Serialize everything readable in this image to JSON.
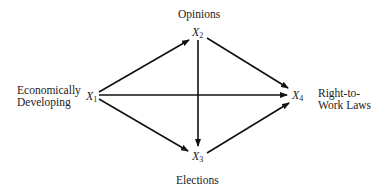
{
  "diagram": {
    "nodes": [
      {
        "id": "X1",
        "var": "X",
        "sub": "1",
        "label_lines": [
          "Economically",
          "Developing"
        ]
      },
      {
        "id": "X2",
        "var": "X",
        "sub": "2",
        "label_lines": [
          "Opinions"
        ]
      },
      {
        "id": "X3",
        "var": "X",
        "sub": "3",
        "label_lines": [
          "Elections"
        ]
      },
      {
        "id": "X4",
        "var": "X",
        "sub": "4",
        "label_lines": [
          "Right-to-",
          "Work Laws"
        ]
      }
    ],
    "edges": [
      {
        "from": "X1",
        "to": "X2"
      },
      {
        "from": "X1",
        "to": "X4"
      },
      {
        "from": "X1",
        "to": "X3"
      },
      {
        "from": "X2",
        "to": "X4"
      },
      {
        "from": "X2",
        "to": "X3"
      },
      {
        "from": "X3",
        "to": "X4"
      }
    ]
  }
}
